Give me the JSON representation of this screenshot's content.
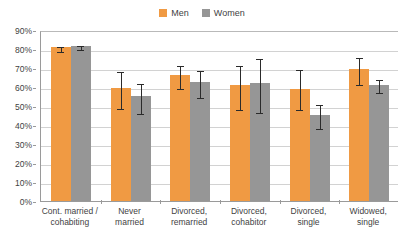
{
  "chart_data": {
    "type": "bar",
    "title": "",
    "subtitle": "",
    "xlabel": "",
    "ylabel": "",
    "ylim": [
      0,
      90
    ],
    "ytick_labels": [
      "0%",
      "10%",
      "20%",
      "30%",
      "40%",
      "50%",
      "60%",
      "70%",
      "80%",
      "90%"
    ],
    "ytick_values": [
      0,
      10,
      20,
      30,
      40,
      50,
      60,
      70,
      80,
      90
    ],
    "grid": true,
    "legend_position": "top-center",
    "categories": [
      "Cont. married / cohabiting",
      "Never married",
      "Divorced, remarried",
      "Divorced, cohabitor",
      "Divorced, single",
      "Widowed, single"
    ],
    "category_lines": [
      [
        "Cont. married /",
        "cohabiting"
      ],
      [
        "Never",
        "married"
      ],
      [
        "Divorced,",
        "remarried"
      ],
      [
        "Divorced,",
        "cohabitor"
      ],
      [
        "Divorced,",
        "single"
      ],
      [
        "Widowed,",
        "single"
      ]
    ],
    "series": [
      {
        "name": "Men",
        "color": "#f09a43",
        "values": [
          81.0,
          59.7,
          66.2,
          61.2,
          59.0,
          69.3
        ],
        "error_low": [
          79.5,
          49.7,
          60.2,
          48.7,
          49.0,
          62.0
        ],
        "error_high": [
          82.3,
          69.0,
          72.2,
          72.0,
          70.0,
          76.5
        ]
      },
      {
        "name": "Women",
        "color": "#969696",
        "values": [
          81.6,
          55.2,
          62.6,
          61.9,
          45.3,
          61.2
        ],
        "error_low": [
          80.3,
          46.8,
          55.5,
          47.2,
          38.9,
          58.0
        ],
        "error_high": [
          82.8,
          62.6,
          69.5,
          76.0,
          51.7,
          65.0
        ]
      }
    ]
  },
  "legend": {
    "entries": [
      {
        "label": "Men",
        "color": "#f09a43"
      },
      {
        "label": "Women",
        "color": "#969696"
      }
    ]
  }
}
